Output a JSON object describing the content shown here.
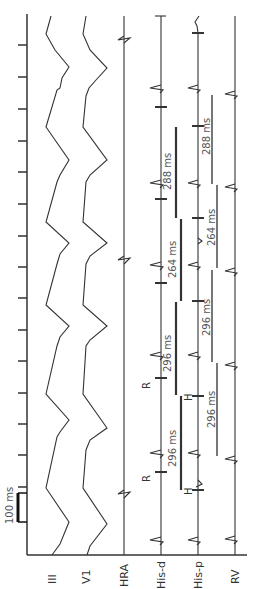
{
  "figure": {
    "type": "intracardiac electrogram tracing (rotated 90° counter-clockwise)",
    "scale_bar": {
      "label": "100 ms"
    },
    "channels": [
      {
        "id": "III",
        "label": "III"
      },
      {
        "id": "V1",
        "label": "V1"
      },
      {
        "id": "HRA",
        "label": "HRA"
      },
      {
        "id": "His-d",
        "label": "His-d"
      },
      {
        "id": "His-p",
        "label": "His-p"
      },
      {
        "id": "RV",
        "label": "RV"
      }
    ],
    "markers": {
      "r_label": "R",
      "h_label": "H"
    },
    "his_d_intervals": [
      {
        "label": "288 ms"
      },
      {
        "label": "264 ms"
      },
      {
        "label": "296 ms"
      },
      {
        "label": "296 ms"
      }
    ],
    "his_p_intervals": [
      {
        "label": "288 ms"
      },
      {
        "label": "264 ms"
      },
      {
        "label": "296 ms"
      },
      {
        "label": "296 ms"
      }
    ],
    "colors": {
      "trace": "#333333",
      "his_d_bar": "#333333",
      "his_p_bar": "#777777",
      "background": "#ffffff"
    }
  }
}
